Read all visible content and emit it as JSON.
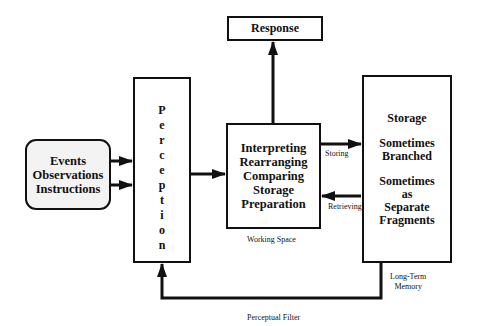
{
  "diagram": {
    "type": "flowchart",
    "nodes": {
      "events": {
        "lines": [
          "Events",
          "Observations",
          "Instructions"
        ]
      },
      "perception": {
        "letters": [
          "P",
          "e",
          "r",
          "c",
          "e",
          "p",
          "t",
          "i",
          "o",
          "n"
        ],
        "label": "Perception"
      },
      "response": {
        "label": "Response"
      },
      "working": {
        "lines": [
          "Interpreting",
          "Rearranging",
          "Comparing",
          "Storage",
          "Preparation"
        ],
        "caption": "Working Space"
      },
      "storage": {
        "groups": [
          [
            "Storage"
          ],
          [
            "Sometimes",
            "Branched"
          ],
          [
            "Sometimes",
            "as",
            "Separate",
            "Fragments"
          ]
        ],
        "caption_lines": [
          "Long-Term",
          "Memory"
        ]
      }
    },
    "edges": [
      {
        "from": "events",
        "to": "perception",
        "count": 2
      },
      {
        "from": "perception",
        "to": "working"
      },
      {
        "from": "working",
        "to": "response"
      },
      {
        "from": "working",
        "to": "storage",
        "label": "Storing"
      },
      {
        "from": "storage",
        "to": "working",
        "label": "Retrieving"
      },
      {
        "from": "storage",
        "to": "perception",
        "label": "Perceptual Filter"
      }
    ],
    "edge_labels": {
      "storing": "Storing",
      "retrieving": "Retrieving",
      "perceptual_filter": "Perceptual Filter"
    }
  }
}
